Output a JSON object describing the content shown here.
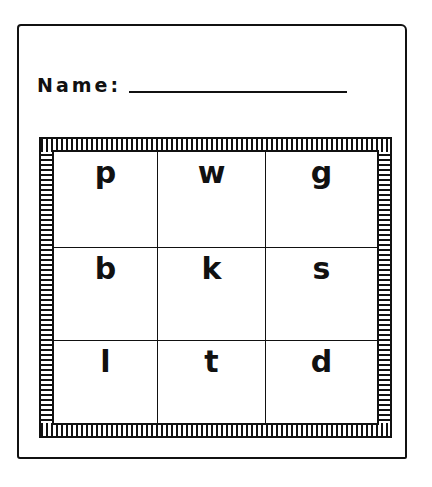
{
  "worksheet": {
    "name_label": "Name:",
    "name_value": "",
    "grid": {
      "rows": 3,
      "columns": 3,
      "cells": [
        [
          "p",
          "w",
          "g"
        ],
        [
          "b",
          "k",
          "s"
        ],
        [
          "l",
          "t",
          "d"
        ]
      ]
    },
    "colors": {
      "ink": "#111111",
      "paper": "#ffffff"
    }
  }
}
